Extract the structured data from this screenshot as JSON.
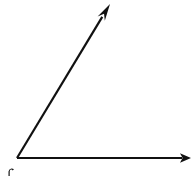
{
  "figure": {
    "title": "angle-diagram",
    "description": "Acute angle formed by two rays sharing a common vertex",
    "background_color": "#ffffff",
    "stroke_color": "#111111",
    "stroke_width": 2,
    "canvas": {
      "width": 193,
      "height": 176
    },
    "vertex": {
      "x": 17,
      "y": 158
    },
    "rays": [
      {
        "name": "horizontal-ray",
        "from": {
          "x": 17,
          "y": 158
        },
        "to": {
          "x": 191,
          "y": 158
        },
        "direction_degrees": 0,
        "arrowhead": "triangle-right",
        "length_px": 174
      },
      {
        "name": "slanted-ray",
        "from": {
          "x": 17,
          "y": 158
        },
        "to": {
          "x": 110,
          "y": 4
        },
        "direction_degrees": 58.9,
        "arrowhead": "triangle-up-right",
        "length_px": 180
      }
    ],
    "angle_between_rays_degrees": 59,
    "angle_type": "acute",
    "marks": [
      {
        "name": "vertex-label-fragment",
        "x": 8,
        "y": 168,
        "width": 6,
        "height": 8,
        "note": "partial glyph clipped by bottom edge"
      }
    ]
  }
}
